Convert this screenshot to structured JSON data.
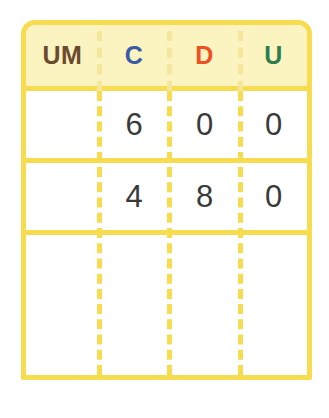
{
  "worksheet": {
    "title": "Place value addition table",
    "colors": {
      "border": "#F8DC50",
      "header_background": "#FBF3C0",
      "digit": "#3a3a3a",
      "sum_line": "#4a4a52"
    }
  },
  "table": {
    "columns": [
      {
        "key": "um",
        "label": "UM",
        "color": "#6B4A2F"
      },
      {
        "key": "c",
        "label": "C",
        "color": "#3B5BA8"
      },
      {
        "key": "d",
        "label": "D",
        "color": "#F04E23"
      },
      {
        "key": "u",
        "label": "U",
        "color": "#2E7D4F"
      }
    ],
    "rows": [
      {
        "type": "addend",
        "cells": [
          "",
          "6",
          "0",
          "0"
        ]
      },
      {
        "type": "addend",
        "cells": [
          "",
          "4",
          "8",
          "0"
        ]
      },
      {
        "type": "answer",
        "cells": [
          "",
          "",
          "",
          ""
        ]
      }
    ],
    "sum_line": {
      "visible": true
    }
  }
}
